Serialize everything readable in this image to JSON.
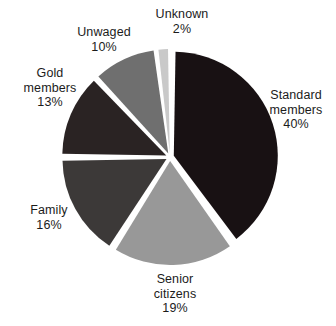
{
  "chart_data": {
    "type": "pie",
    "title": "",
    "subtitle": "",
    "xlabel": "",
    "ylabel": "",
    "legend_position": "none",
    "grid": false,
    "labels_inline": true,
    "unit": "%",
    "categories": [
      "Standard members",
      "Senior citizens",
      "Family",
      "Gold members",
      "Unwaged",
      "Unknown"
    ],
    "values": [
      40,
      19,
      16,
      13,
      10,
      2
    ],
    "slices": [
      {
        "name": "standard-members",
        "label": "Standard\nmembers\n40%",
        "label_name": "Standard members",
        "value": 40,
        "value_text": "40%",
        "color": "#181113",
        "start_angle": 0,
        "end_angle": 144,
        "explode": 4
      },
      {
        "name": "senior-citizens",
        "label": "Senior\ncitizens\n19%",
        "label_name": "Senior citizens",
        "value": 19,
        "value_text": "19%",
        "color": "#989898",
        "start_angle": 144,
        "end_angle": 212.4,
        "explode": 4
      },
      {
        "name": "family",
        "label": "Family\n16%",
        "label_name": "Family",
        "value": 16,
        "value_text": "16%",
        "color": "#3c3938",
        "start_angle": 212.4,
        "end_angle": 270,
        "explode": 4
      },
      {
        "name": "gold-members",
        "label": "Gold\nmembers\n13%",
        "label_name": "Gold members",
        "value": 13,
        "value_text": "13%",
        "color": "#2a2323",
        "start_angle": 270,
        "end_angle": 316.8,
        "explode": 4
      },
      {
        "name": "unwaged",
        "label": "Unwaged\n10%",
        "label_name": "Unwaged",
        "value": 10,
        "value_text": "10%",
        "color": "#6f6f6f",
        "start_angle": 316.8,
        "end_angle": 352.8,
        "explode": 4
      },
      {
        "name": "unknown",
        "label": "Unknown\n2%",
        "label_name": "Unknown",
        "value": 2,
        "value_text": "2%",
        "color": "#c9c9c9",
        "start_angle": 352.8,
        "end_angle": 360,
        "explode": 4
      }
    ],
    "geometry": {
      "cx": 170,
      "cy": 157,
      "radius": 104,
      "gap_deg": 1.9,
      "background": "#ffffff"
    }
  }
}
